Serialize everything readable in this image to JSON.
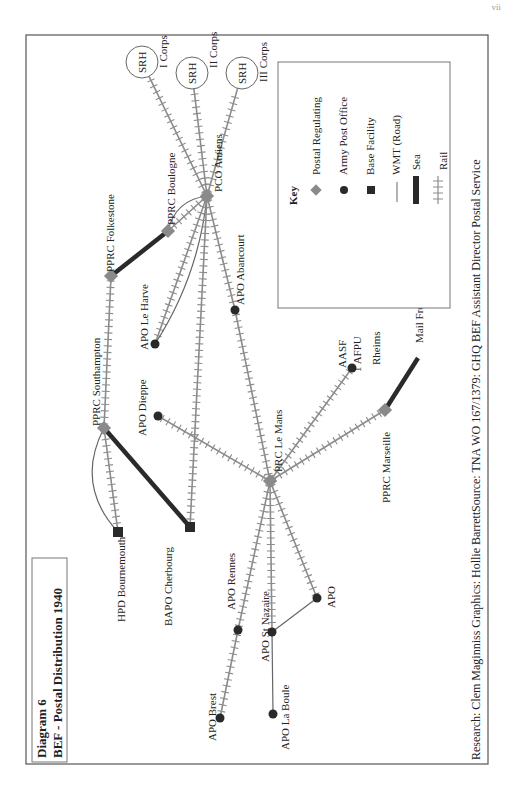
{
  "page_number": "vii",
  "title_box": {
    "line1": "Diagram 6",
    "line2": "BEF - Postal Distribution 1940"
  },
  "credits": "Research: Clem Maginniss  Graphics: Hollie Barrett",
  "source": "Source: TNA WO 167/1379: GHQ BEF Assistant Director Postal Service",
  "key": {
    "title": "Key",
    "items": [
      {
        "symbol": "diamond",
        "label": "Postal Regulating"
      },
      {
        "symbol": "circle",
        "label": "Army Post Office"
      },
      {
        "symbol": "square",
        "label": "Base Facility"
      },
      {
        "symbol": "thin-line",
        "label": "WMT (Road)"
      },
      {
        "symbol": "thick-line",
        "label": "Sea"
      },
      {
        "symbol": "rail-line",
        "label": "Rail"
      }
    ]
  },
  "colors": {
    "postal_regulating": "#8a8a8a",
    "node_dark": "#2a2a2a",
    "rail": "#8c8c8c",
    "sea": "#2a2a2a",
    "road": "#666666",
    "frame": "#555555"
  },
  "nodes": {
    "srh1": {
      "label": "SRH",
      "sub": "I Corps"
    },
    "srh2": {
      "label": "SRH",
      "sub": "II Corps"
    },
    "srh3": {
      "label": "SRH",
      "sub": "III Corps"
    },
    "amiens": {
      "label": "PCO Amiens",
      "type": "postal-regulating"
    },
    "boulogne": {
      "label": "PPRC Boulogne",
      "type": "postal-regulating"
    },
    "folkestone": {
      "label": "PPRC Folkestone",
      "type": "postal-regulating"
    },
    "southampton": {
      "label": "PPRC Southampton",
      "type": "postal-regulating"
    },
    "lemans": {
      "label": "PRC Le Mans",
      "type": "postal-regulating"
    },
    "marseille": {
      "label": "PPRC Marseille",
      "type": "postal-regulating"
    },
    "mailindia": {
      "label": "Mail From India",
      "type": "endpoint"
    },
    "leharve": {
      "label": "APO Le Harve",
      "type": "army-post-office"
    },
    "abancourt": {
      "label": "APO Abancourt",
      "type": "army-post-office"
    },
    "dieppe": {
      "label": "APO Dieppe",
      "type": "army-post-office"
    },
    "aasf": {
      "label": "AASF",
      "label2": "1 AFPU",
      "label3": "Rheims",
      "type": "army-post-office"
    },
    "bournemouth": {
      "label": "HPD Bournemouth",
      "type": "base-facility"
    },
    "cherbourg": {
      "label": "BAPO Cherbourg",
      "type": "base-facility"
    },
    "rennes": {
      "label": "APO Rennes",
      "type": "army-post-office"
    },
    "brest": {
      "label": "APO Brest",
      "type": "army-post-office"
    },
    "stnazaire": {
      "label": "APO St Nazaire",
      "type": "army-post-office"
    },
    "labaule": {
      "label": "APO La Boule",
      "type": "army-post-office"
    },
    "apo": {
      "label": "APO",
      "type": "army-post-office"
    }
  },
  "links": [
    {
      "from": "amiens",
      "to": "srh1",
      "mode": "rail"
    },
    {
      "from": "amiens",
      "to": "srh2",
      "mode": "rail"
    },
    {
      "from": "amiens",
      "to": "srh3",
      "mode": "rail"
    },
    {
      "from": "amiens",
      "to": "boulogne",
      "mode": "rail"
    },
    {
      "from": "amiens",
      "to": "boulogne",
      "mode": "road"
    },
    {
      "from": "boulogne",
      "to": "folkestone",
      "mode": "sea"
    },
    {
      "from": "folkestone",
      "to": "southampton",
      "mode": "rail"
    },
    {
      "from": "southampton",
      "to": "bournemouth",
      "mode": "rail"
    },
    {
      "from": "southampton",
      "to": "bournemouth",
      "mode": "road"
    },
    {
      "from": "southampton",
      "to": "cherbourg",
      "mode": "sea"
    },
    {
      "from": "amiens",
      "to": "leharve",
      "mode": "rail"
    },
    {
      "from": "amiens",
      "to": "leharve",
      "mode": "road"
    },
    {
      "from": "amiens",
      "to": "cherbourg",
      "mode": "rail"
    },
    {
      "from": "amiens",
      "to": "abancourt",
      "mode": "rail"
    },
    {
      "from": "abancourt",
      "to": "lemans",
      "mode": "rail"
    },
    {
      "from": "dieppe",
      "to": "lemans",
      "mode": "rail"
    },
    {
      "from": "lemans",
      "to": "aasf",
      "mode": "rail"
    },
    {
      "from": "lemans",
      "to": "marseille",
      "mode": "rail"
    },
    {
      "from": "marseille",
      "to": "mailindia",
      "mode": "sea"
    },
    {
      "from": "lemans",
      "to": "rennes",
      "mode": "rail"
    },
    {
      "from": "rennes",
      "to": "brest",
      "mode": "rail"
    },
    {
      "from": "lemans",
      "to": "stnazaire",
      "mode": "rail"
    },
    {
      "from": "lemans",
      "to": "apo",
      "mode": "rail"
    },
    {
      "from": "stnazaire",
      "to": "apo",
      "mode": "road"
    },
    {
      "from": "stnazaire",
      "to": "labaule",
      "mode": "road"
    }
  ]
}
